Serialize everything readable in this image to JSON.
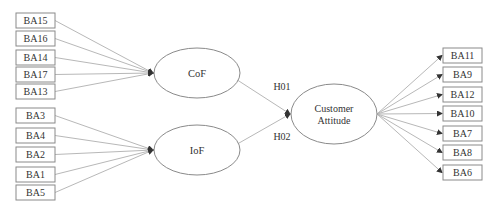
{
  "diagram": {
    "type": "structural-model",
    "colors": {
      "line": "#b8b8b8",
      "border": "#8a8a8a",
      "text": "#333333",
      "background": "#ffffff"
    },
    "constructs": [
      {
        "id": "cof",
        "label": "CoF",
        "indicators": [
          "BA15",
          "BA16",
          "BA14",
          "BA17",
          "BA13"
        ]
      },
      {
        "id": "iof",
        "label": "IoF",
        "indicators": [
          "BA3",
          "BA4",
          "BA2",
          "BA1",
          "BA5"
        ]
      }
    ],
    "outcome": {
      "id": "ca",
      "label_lines": [
        "Customer",
        "Attitude"
      ],
      "indicators": [
        "BA11",
        "BA9",
        "BA12",
        "BA10",
        "BA7",
        "BA8",
        "BA6"
      ]
    },
    "hypotheses": [
      {
        "label": "H01",
        "from": "cof",
        "to": "ca"
      },
      {
        "label": "H02",
        "from": "iof",
        "to": "ca"
      }
    ]
  }
}
